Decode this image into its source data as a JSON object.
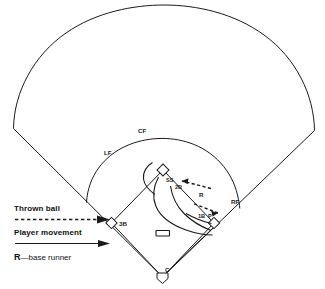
{
  "diagram": {
    "field": {
      "outfield_fence_label": "outfield-fence",
      "infield_arc_label": "infield-dirt-arc",
      "foul_lines_label": "foul-lines"
    },
    "positions": [
      {
        "id": "lf",
        "label": "LF",
        "name": "left-fielder",
        "x": 104,
        "y": 155
      },
      {
        "id": "cf",
        "label": "CF",
        "name": "center-fielder",
        "x": 138,
        "y": 133
      },
      {
        "id": "rf",
        "label": "RF",
        "name": "right-fielder",
        "x": 231,
        "y": 204
      },
      {
        "id": "ss",
        "label": "SS",
        "name": "shortstop",
        "x": 166,
        "y": 182
      },
      {
        "id": "2b",
        "label": "2B",
        "name": "second-baseman",
        "x": 175,
        "y": 189
      },
      {
        "id": "1b",
        "label": "1B",
        "name": "first-baseman",
        "x": 198,
        "y": 218
      },
      {
        "id": "3b",
        "label": "3B",
        "name": "third-baseman",
        "x": 119,
        "y": 226
      },
      {
        "id": "c",
        "label": "C",
        "name": "catcher",
        "x": 165,
        "y": 272
      },
      {
        "id": "r",
        "label": "R",
        "name": "base-runner-marker",
        "x": 199,
        "y": 197
      },
      {
        "id": "p",
        "label": "P",
        "name": "pitcher-marker",
        "x": 208,
        "y": 218
      }
    ],
    "bases": [
      {
        "id": "home",
        "name": "home-plate"
      },
      {
        "id": "first",
        "name": "first-base"
      },
      {
        "id": "second",
        "name": "second-base"
      },
      {
        "id": "third",
        "name": "third-base"
      },
      {
        "id": "rubber",
        "name": "pitchers-rubber"
      }
    ],
    "legend": {
      "thrown_ball": "Thrown ball",
      "player_movement": "Player movement",
      "base_runner_key": "R",
      "base_runner_text": "—base runner"
    },
    "colors": {
      "ink": "#1a1a1a",
      "background": "#ffffff"
    }
  }
}
